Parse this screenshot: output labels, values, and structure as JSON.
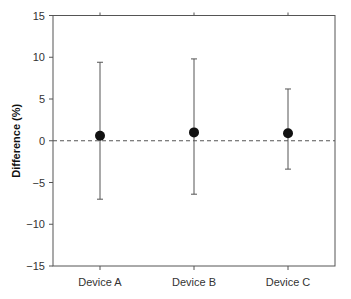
{
  "chart_data": {
    "type": "scatter",
    "subtype": "point-with-error-bars",
    "title": "",
    "xlabel": "",
    "ylabel": "Difference (%)",
    "ylim": [
      -15,
      15
    ],
    "yticks": [
      15,
      10,
      5,
      0,
      -5,
      -10,
      -15
    ],
    "ytick_labels": [
      "15",
      "10",
      "5",
      "0",
      "−5",
      "−10",
      "−15"
    ],
    "categories": [
      "Device A",
      "Device B",
      "Device C"
    ],
    "series": [
      {
        "name": "Difference",
        "values": [
          0.6,
          1.0,
          0.9
        ],
        "error_upper": [
          9.4,
          9.8,
          6.2
        ],
        "error_lower": [
          -7.0,
          -6.4,
          -3.4
        ]
      }
    ],
    "reference_line": {
      "y": 0,
      "style": "dashed"
    },
    "grid": false,
    "legend": null
  },
  "colors": {
    "point": "#111111",
    "error_bar": "#555555",
    "axis": "#555555",
    "reference_line": "#555555"
  }
}
